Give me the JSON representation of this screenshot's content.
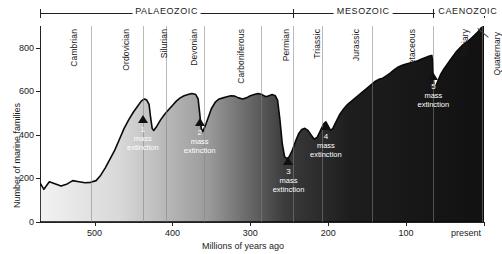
{
  "chart_data": {
    "type": "area",
    "title": "",
    "xlabel": "Millions of years ago",
    "ylabel": "Number of marine families",
    "xlim": [
      570,
      0
    ],
    "ylim": [
      0,
      900
    ],
    "x_ticks": [
      {
        "value": 500,
        "label": "500"
      },
      {
        "value": 400,
        "label": "400"
      },
      {
        "value": 300,
        "label": "300"
      },
      {
        "value": 200,
        "label": "200"
      },
      {
        "value": 100,
        "label": "100"
      },
      {
        "value": 0,
        "label": "present"
      }
    ],
    "y_ticks": [
      {
        "value": 0,
        "label": "0"
      },
      {
        "value": 200,
        "label": "200"
      },
      {
        "value": 400,
        "label": "400"
      },
      {
        "value": 600,
        "label": "600"
      },
      {
        "value": 800,
        "label": "800"
      }
    ],
    "grid": "vertical-period-boundaries",
    "legend": "none",
    "series": [
      {
        "name": "Number of marine families",
        "points": [
          [
            570,
            180
          ],
          [
            565,
            150
          ],
          [
            558,
            185
          ],
          [
            550,
            175
          ],
          [
            543,
            165
          ],
          [
            535,
            175
          ],
          [
            528,
            190
          ],
          [
            520,
            185
          ],
          [
            512,
            180
          ],
          [
            505,
            182
          ],
          [
            498,
            190
          ],
          [
            492,
            215
          ],
          [
            486,
            250
          ],
          [
            480,
            290
          ],
          [
            474,
            330
          ],
          [
            468,
            380
          ],
          [
            462,
            430
          ],
          [
            456,
            470
          ],
          [
            450,
            505
          ],
          [
            444,
            535
          ],
          [
            440,
            555
          ],
          [
            436,
            565
          ],
          [
            433,
            560
          ],
          [
            430,
            540
          ],
          [
            428,
            480
          ],
          [
            426,
            430
          ],
          [
            424,
            420
          ],
          [
            420,
            440
          ],
          [
            415,
            470
          ],
          [
            410,
            495
          ],
          [
            405,
            515
          ],
          [
            400,
            535
          ],
          [
            395,
            555
          ],
          [
            390,
            570
          ],
          [
            385,
            580
          ],
          [
            380,
            585
          ],
          [
            375,
            590
          ],
          [
            370,
            585
          ],
          [
            367,
            565
          ],
          [
            365,
            500
          ],
          [
            363,
            430
          ],
          [
            361,
            415
          ],
          [
            358,
            440
          ],
          [
            354,
            480
          ],
          [
            350,
            520
          ],
          [
            345,
            550
          ],
          [
            340,
            565
          ],
          [
            335,
            570
          ],
          [
            330,
            575
          ],
          [
            325,
            580
          ],
          [
            320,
            578
          ],
          [
            315,
            570
          ],
          [
            310,
            565
          ],
          [
            305,
            570
          ],
          [
            300,
            580
          ],
          [
            295,
            585
          ],
          [
            290,
            590
          ],
          [
            285,
            585
          ],
          [
            280,
            575
          ],
          [
            276,
            580
          ],
          [
            272,
            585
          ],
          [
            268,
            580
          ],
          [
            265,
            560
          ],
          [
            262,
            470
          ],
          [
            259,
            360
          ],
          [
            256,
            300
          ],
          [
            253,
            290
          ],
          [
            250,
            300
          ],
          [
            246,
            330
          ],
          [
            242,
            370
          ],
          [
            238,
            405
          ],
          [
            234,
            425
          ],
          [
            230,
            430
          ],
          [
            226,
            420
          ],
          [
            222,
            400
          ],
          [
            218,
            380
          ],
          [
            214,
            390
          ],
          [
            210,
            420
          ],
          [
            206,
            450
          ],
          [
            203,
            460
          ],
          [
            200,
            440
          ],
          [
            197,
            420
          ],
          [
            194,
            430
          ],
          [
            190,
            460
          ],
          [
            185,
            495
          ],
          [
            180,
            520
          ],
          [
            175,
            540
          ],
          [
            170,
            555
          ],
          [
            165,
            570
          ],
          [
            160,
            585
          ],
          [
            155,
            600
          ],
          [
            150,
            615
          ],
          [
            145,
            630
          ],
          [
            140,
            645
          ],
          [
            135,
            655
          ],
          [
            130,
            660
          ],
          [
            125,
            672
          ],
          [
            120,
            685
          ],
          [
            115,
            700
          ],
          [
            110,
            712
          ],
          [
            105,
            720
          ],
          [
            100,
            725
          ],
          [
            95,
            730
          ],
          [
            90,
            735
          ],
          [
            85,
            740
          ],
          [
            80,
            748
          ],
          [
            75,
            755
          ],
          [
            70,
            762
          ],
          [
            67,
            765
          ],
          [
            66,
            740
          ],
          [
            65,
            660
          ],
          [
            64,
            620
          ],
          [
            63,
            615
          ],
          [
            60,
            640
          ],
          [
            56,
            675
          ],
          [
            52,
            700
          ],
          [
            48,
            720
          ],
          [
            44,
            740
          ],
          [
            40,
            760
          ],
          [
            36,
            780
          ],
          [
            32,
            795
          ],
          [
            28,
            810
          ],
          [
            24,
            822
          ],
          [
            20,
            832
          ],
          [
            16,
            845
          ],
          [
            12,
            858
          ],
          [
            8,
            872
          ],
          [
            4,
            890
          ],
          [
            0,
            900
          ]
        ]
      }
    ],
    "fill_gradient": {
      "left": "#f2f2f2",
      "right": "#111111"
    },
    "annotations": [
      {
        "id": "1",
        "number": "1",
        "line1": "mass",
        "line2": "extinction",
        "x_ma": 438,
        "y_value": 480,
        "marker": "triangle-dark"
      },
      {
        "id": "2",
        "number": "2",
        "line1": "mass",
        "line2": "extinction",
        "x_ma": 365,
        "y_value": 470,
        "marker": "triangle-dark"
      },
      {
        "id": "3",
        "number": "3",
        "line1": "mass",
        "line2": "extinction",
        "x_ma": 251,
        "y_value": 290,
        "marker": "triangle-dark"
      },
      {
        "id": "4",
        "number": "4",
        "line1": "mass",
        "line2": "extinction",
        "x_ma": 203,
        "y_value": 450,
        "marker": "triangle-dark"
      },
      {
        "id": "5",
        "number": "5",
        "line1": "mass",
        "line2": "extinction",
        "x_ma": 65,
        "y_value": 680,
        "marker": "triangle-dark"
      }
    ],
    "eras": [
      {
        "name": "PALAEOZOIC",
        "start_ma": 570,
        "end_ma": 245
      },
      {
        "name": "MESOZOIC",
        "start_ma": 245,
        "end_ma": 65
      },
      {
        "name": "CAENOZOIC",
        "start_ma": 65,
        "end_ma": 0
      }
    ],
    "periods": [
      {
        "name": "Cambrian",
        "start_ma": 570,
        "end_ma": 505
      },
      {
        "name": "Ordovician",
        "start_ma": 505,
        "end_ma": 438
      },
      {
        "name": "Silurian",
        "start_ma": 438,
        "end_ma": 408
      },
      {
        "name": "Devonian",
        "start_ma": 408,
        "end_ma": 360
      },
      {
        "name": "Carboniferous",
        "start_ma": 360,
        "end_ma": 286
      },
      {
        "name": "Permian",
        "start_ma": 286,
        "end_ma": 245
      },
      {
        "name": "Triassic",
        "start_ma": 245,
        "end_ma": 208
      },
      {
        "name": "Jurassic",
        "start_ma": 208,
        "end_ma": 144
      },
      {
        "name": "Cretaceous",
        "start_ma": 144,
        "end_ma": 65
      },
      {
        "name": "Tertiary",
        "start_ma": 65,
        "end_ma": 2
      },
      {
        "name": "Quaternary",
        "start_ma": 2,
        "end_ma": 0
      }
    ]
  }
}
